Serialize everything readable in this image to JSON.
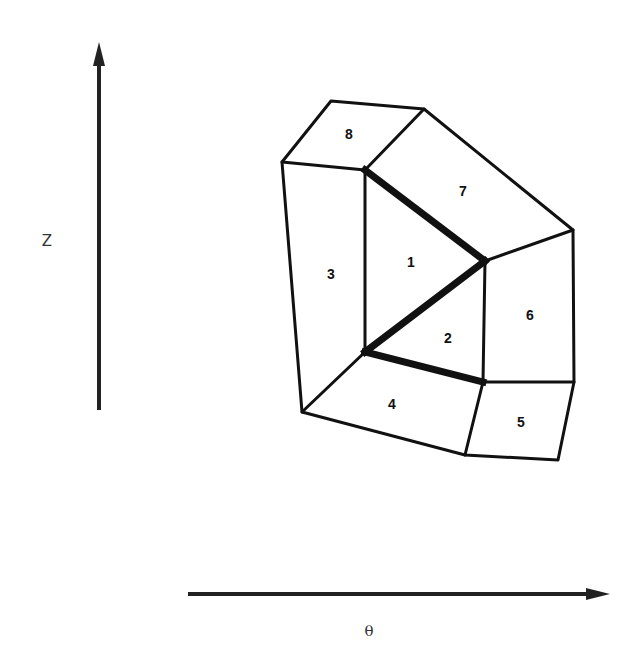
{
  "axes": {
    "vertical": {
      "label": "Z",
      "direction": "up"
    },
    "horizontal": {
      "label": "θ",
      "direction": "right"
    }
  },
  "mesh": {
    "description": "Polygonal mesh of 8 numbered cells surrounding a central triangle split into cells 1 and 2; the central triangle edges are emphasized (bold).",
    "cells": [
      {
        "id": "1",
        "label": "1"
      },
      {
        "id": "2",
        "label": "2"
      },
      {
        "id": "3",
        "label": "3"
      },
      {
        "id": "4",
        "label": "4"
      },
      {
        "id": "5",
        "label": "5"
      },
      {
        "id": "6",
        "label": "6"
      },
      {
        "id": "7",
        "label": "7"
      },
      {
        "id": "8",
        "label": "8"
      }
    ],
    "bold_edges": [
      "inner-top-left to inner-right",
      "inner-right to inner-bottom-left",
      "inner-bottom-left to inner-bottom-right"
    ]
  }
}
